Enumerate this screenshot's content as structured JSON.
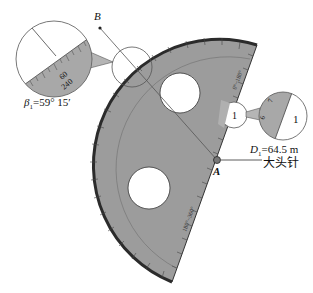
{
  "figure": {
    "point_b": {
      "label": "B"
    },
    "point_a": {
      "label": "A"
    },
    "pin_label": "大头针",
    "beta": {
      "symbol": "β",
      "subscript": "1",
      "value": "=59° 15′"
    },
    "distance": {
      "symbol": "D",
      "subscript": "1",
      "value": "=64.5 m"
    },
    "left_magnifier": {
      "tick_labels": [
        "60",
        "240"
      ]
    },
    "right_magnifier": {
      "label": "1",
      "tick_labels": [
        "7",
        "6"
      ]
    },
    "small_circle_label": "1",
    "protractor": {
      "scale_labels_outer": [
        "0",
        "10",
        "20",
        "30",
        "40",
        "50",
        "60",
        "70",
        "80",
        "90",
        "100",
        "110",
        "120",
        "130",
        "140",
        "150",
        "160",
        "170",
        "180"
      ],
      "edge_labels": [
        "0°~180°",
        "180°~360°"
      ]
    },
    "colors": {
      "protractor_fill": "#9a9a9a",
      "protractor_edge": "#2b2b2b",
      "line": "#555555"
    }
  }
}
